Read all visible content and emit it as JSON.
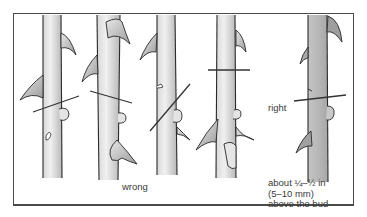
{
  "figure": {
    "labels": {
      "wrong": "wrong",
      "right": "right",
      "note_line1": "about ¼–½ in",
      "note_line2": "(5–10 mm)",
      "note_line3": "above the bud"
    },
    "examples": [
      {
        "id": 1,
        "verdict": "wrong",
        "cut": "sloped cut, too close, angled toward bud"
      },
      {
        "id": 2,
        "verdict": "wrong",
        "cut": "sloped cut too far above bud"
      },
      {
        "id": 3,
        "verdict": "wrong",
        "cut": "steep diagonal cut through bud"
      },
      {
        "id": 4,
        "verdict": "wrong",
        "cut": "straight cut far above bud"
      },
      {
        "id": 5,
        "verdict": "right",
        "cut": "slight slope about 1/4-1/2 in above bud"
      }
    ],
    "colors": {
      "stem_light": "#e6e6e6",
      "stem_shade": "#bdbdbd",
      "stem_right": "#b4b4b4",
      "outline": "#2a2a2a",
      "frame": "#4a4a4a",
      "text": "#3a3a3a"
    }
  }
}
